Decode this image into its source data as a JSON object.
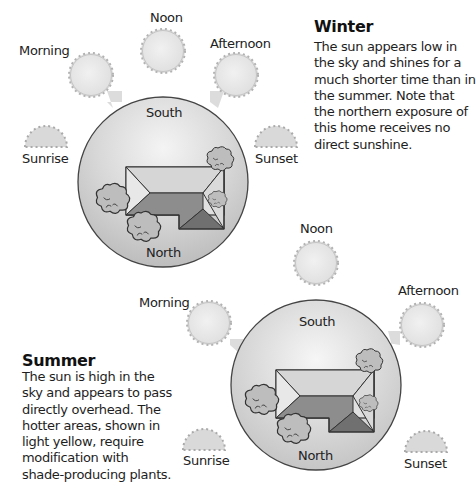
{
  "winter": {
    "title": "Winter",
    "description": "The sun appears low in the sky and shines for a much shorter time than in the summer. Note that the northern exposure of this home receives no direct sunshine.",
    "sun_labels": {
      "noon": "Noon",
      "morning": "Morning",
      "afternoon": "Afternoon",
      "sunrise": "Sunrise",
      "sunset": "Sunset"
    },
    "compass": {
      "south": "South",
      "north": "North"
    }
  },
  "summer": {
    "title": "Summer",
    "description": "The sun is high in the sky and appears to pass directly overhead. The hotter areas, shown in light yellow, require modification with shade-producing plants.",
    "sun_labels": {
      "noon": "Noon",
      "morning": "Morning",
      "afternoon": "Afternoon",
      "sunrise": "Sunrise",
      "sunset": "Sunset"
    },
    "compass": {
      "south": "South",
      "north": "North"
    }
  },
  "colors": {
    "sun_fill": "#e6e6e6",
    "sun_edge": "#a8a8a8",
    "yard_fill": "#c9c9c9",
    "roof_light": "#dcdcdc",
    "roof_mid": "#8f8f8f",
    "roof_dark": "#6e6e6e"
  }
}
